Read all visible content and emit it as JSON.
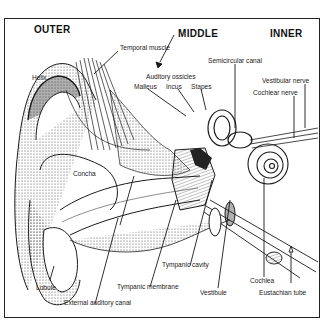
{
  "diagram": {
    "sections": {
      "outer": "OUTER",
      "middle": "MIDDLE",
      "inner": "INNER"
    },
    "labels": {
      "temporal_muscle": "Temporal muscle",
      "helix": "Helix",
      "auditory_ossicles": "Auditory ossicles",
      "malleus": "Malleus",
      "incus": "Incus",
      "stapes": "Stapes",
      "semicircular_canal": "Semicircular canal",
      "vestibular_nerve": "Vestibular nerve",
      "cochlear_nerve": "Cochlear nerve",
      "concha": "Concha",
      "lobule": "Lobule",
      "external_auditory_canal": "External auditory canal",
      "tympanic_membrane": "Tympanic membrane",
      "tympanic_cavity": "Tympanic cavity",
      "vestibule": "Vestibule",
      "cochlea": "Cochlea",
      "eustachian_tube": "Eustachian tube"
    },
    "colors": {
      "ink": "#1a1a1a",
      "background": "#ffffff",
      "stipple": "#555555"
    }
  }
}
